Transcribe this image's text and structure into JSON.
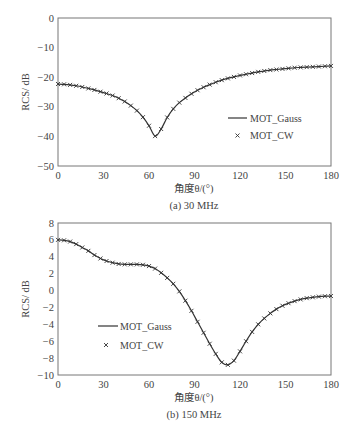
{
  "chart_data": [
    {
      "type": "line",
      "title": "(a) 30 MHz",
      "xlabel": "角度θ/(°)",
      "ylabel": "RCS/ dB",
      "xlim": [
        0,
        180
      ],
      "ylim": [
        -50,
        0
      ],
      "xticks": [
        0,
        30,
        60,
        90,
        120,
        150,
        180
      ],
      "yticks": [
        0,
        -10,
        -20,
        -30,
        -40,
        -50
      ],
      "grid": false,
      "legend_position": "lower right",
      "x": [
        0,
        4,
        8,
        12,
        16,
        20,
        24,
        28,
        32,
        36,
        40,
        44,
        48,
        52,
        56,
        60,
        64,
        68,
        72,
        76,
        80,
        84,
        88,
        92,
        96,
        100,
        104,
        108,
        112,
        116,
        120,
        124,
        128,
        132,
        136,
        140,
        144,
        148,
        152,
        156,
        160,
        164,
        168,
        172,
        176,
        180
      ],
      "series": [
        {
          "name": "MOT_Gauss",
          "style": "line",
          "values": [
            -22.3,
            -22.4,
            -22.6,
            -22.9,
            -23.3,
            -23.8,
            -24.3,
            -24.9,
            -25.5,
            -26.2,
            -27.1,
            -28.2,
            -29.6,
            -31.3,
            -33.5,
            -36.4,
            -39.9,
            -37.5,
            -33.6,
            -30.7,
            -28.6,
            -27.0,
            -25.6,
            -24.4,
            -23.4,
            -22.5,
            -21.7,
            -21.0,
            -20.4,
            -19.9,
            -19.4,
            -19.0,
            -18.6,
            -18.2,
            -17.9,
            -17.6,
            -17.4,
            -17.2,
            -17.0,
            -16.8,
            -16.7,
            -16.6,
            -16.5,
            -16.4,
            -16.3,
            -16.2
          ]
        },
        {
          "name": "MOT_CW",
          "style": "marker-x",
          "values": [
            -22.3,
            -22.4,
            -22.6,
            -22.9,
            -23.3,
            -23.8,
            -24.3,
            -24.9,
            -25.5,
            -26.2,
            -27.1,
            -28.2,
            -29.6,
            -31.3,
            -33.5,
            -36.4,
            -39.9,
            -37.5,
            -33.6,
            -30.7,
            -28.6,
            -27.0,
            -25.6,
            -24.4,
            -23.4,
            -22.5,
            -21.7,
            -21.0,
            -20.4,
            -19.9,
            -19.4,
            -19.0,
            -18.6,
            -18.2,
            -17.9,
            -17.6,
            -17.4,
            -17.2,
            -17.0,
            -16.8,
            -16.7,
            -16.6,
            -16.5,
            -16.4,
            -16.3,
            -16.2
          ]
        }
      ]
    },
    {
      "type": "line",
      "title": "(b) 150 MHz",
      "xlabel": "角度θ/(°)",
      "ylabel": "RCS/ dB",
      "xlim": [
        0,
        180
      ],
      "ylim": [
        -10,
        8
      ],
      "xticks": [
        0,
        30,
        60,
        90,
        120,
        150,
        180
      ],
      "yticks": [
        8,
        6,
        4,
        2,
        0,
        -2,
        -4,
        -6,
        -8,
        -10
      ],
      "grid": false,
      "legend_position": "lower left",
      "x": [
        0,
        4,
        8,
        12,
        16,
        20,
        24,
        28,
        32,
        36,
        40,
        44,
        48,
        52,
        56,
        60,
        64,
        68,
        72,
        76,
        80,
        84,
        88,
        92,
        96,
        100,
        104,
        108,
        112,
        116,
        120,
        124,
        128,
        132,
        136,
        140,
        144,
        148,
        152,
        156,
        160,
        164,
        168,
        172,
        176,
        180
      ],
      "series": [
        {
          "name": "MOT_Gauss",
          "style": "line",
          "values": [
            6.0,
            5.95,
            5.8,
            5.5,
            5.1,
            4.7,
            4.2,
            3.8,
            3.5,
            3.3,
            3.15,
            3.1,
            3.1,
            3.1,
            3.05,
            2.9,
            2.6,
            2.1,
            1.5,
            0.8,
            -0.1,
            -1.2,
            -2.4,
            -3.7,
            -5.0,
            -6.3,
            -7.5,
            -8.5,
            -8.8,
            -8.3,
            -7.2,
            -6.0,
            -4.9,
            -4.0,
            -3.3,
            -2.7,
            -2.2,
            -1.8,
            -1.5,
            -1.25,
            -1.05,
            -0.9,
            -0.8,
            -0.72,
            -0.67,
            -0.65
          ]
        },
        {
          "name": "MOT_CW",
          "style": "marker-x",
          "values": [
            6.0,
            5.95,
            5.8,
            5.5,
            5.1,
            4.7,
            4.2,
            3.8,
            3.5,
            3.3,
            3.15,
            3.1,
            3.1,
            3.1,
            3.05,
            2.9,
            2.6,
            2.1,
            1.5,
            0.8,
            -0.1,
            -1.2,
            -2.4,
            -3.7,
            -5.0,
            -6.3,
            -7.5,
            -8.5,
            -8.8,
            -8.3,
            -7.2,
            -6.0,
            -4.9,
            -4.0,
            -3.3,
            -2.7,
            -2.2,
            -1.8,
            -1.5,
            -1.25,
            -1.05,
            -0.9,
            -0.8,
            -0.72,
            -0.67,
            -0.65
          ]
        }
      ]
    }
  ],
  "colors": {
    "frame": "#777777",
    "curve": "#333333",
    "text": "#444444"
  }
}
